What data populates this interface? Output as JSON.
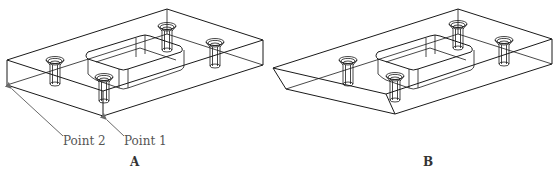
{
  "figures": [
    {
      "id": "A",
      "caption": "A",
      "annotations": [
        {
          "label": "Point 2",
          "target": "left-bottom corner"
        },
        {
          "label": "Point 1",
          "target": "front-bottom corner"
        }
      ]
    },
    {
      "id": "B",
      "caption": "B",
      "annotations": []
    }
  ],
  "colors": {
    "line": "#1a1a1a",
    "arrow": "#6a6a6a",
    "background": "#ffffff"
  }
}
